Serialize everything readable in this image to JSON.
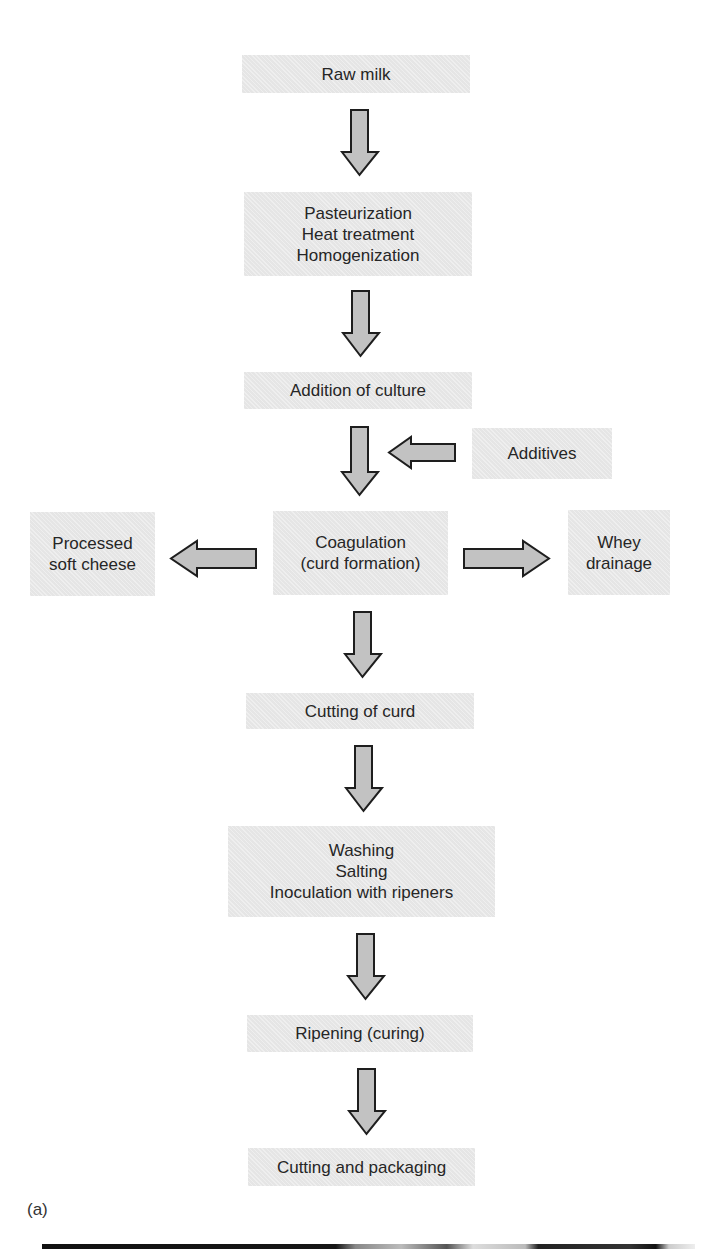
{
  "diagram": {
    "panel_label": "(a)",
    "steps": [
      {
        "id": "raw-milk",
        "lines": [
          "Raw milk"
        ]
      },
      {
        "id": "pasteurization",
        "lines": [
          "Pasteurization",
          "Heat treatment",
          "Homogenization"
        ]
      },
      {
        "id": "addition-of-culture",
        "lines": [
          "Addition of culture"
        ]
      },
      {
        "id": "coagulation",
        "lines": [
          "Coagulation",
          "(curd formation)"
        ]
      },
      {
        "id": "cutting-of-curd",
        "lines": [
          "Cutting of curd"
        ]
      },
      {
        "id": "washing",
        "lines": [
          "Washing",
          "Salting",
          "Inoculation with ripeners"
        ]
      },
      {
        "id": "ripening",
        "lines": [
          "Ripening (curing)"
        ]
      },
      {
        "id": "cutting-packaging",
        "lines": [
          "Cutting and packaging"
        ]
      }
    ],
    "side_nodes": {
      "additives": {
        "lines": [
          "Additives"
        ]
      },
      "processed_soft_cheese": {
        "lines": [
          "Processed",
          "soft cheese"
        ]
      },
      "whey_drainage": {
        "lines": [
          "Whey",
          "drainage"
        ]
      }
    },
    "edges": [
      {
        "from": "Raw milk",
        "to": "Pasteurization",
        "direction": "down"
      },
      {
        "from": "Pasteurization",
        "to": "Addition of culture",
        "direction": "down"
      },
      {
        "from": "Addition of culture",
        "to": "Coagulation",
        "direction": "down"
      },
      {
        "from": "Additives",
        "to": "Coagulation stream",
        "direction": "left"
      },
      {
        "from": "Coagulation",
        "to": "Processed soft cheese",
        "direction": "left"
      },
      {
        "from": "Coagulation",
        "to": "Whey drainage",
        "direction": "right"
      },
      {
        "from": "Coagulation",
        "to": "Cutting of curd",
        "direction": "down"
      },
      {
        "from": "Cutting of curd",
        "to": "Washing / Salting / Inoculation",
        "direction": "down"
      },
      {
        "from": "Washing / Salting / Inoculation",
        "to": "Ripening (curing)",
        "direction": "down"
      },
      {
        "from": "Ripening (curing)",
        "to": "Cutting and packaging",
        "direction": "down"
      }
    ],
    "colors": {
      "box_fill": "#e9e9e9",
      "arrow_fill": "#c2c2c2",
      "arrow_stroke": "#1e1e1e",
      "text": "#262626"
    }
  }
}
